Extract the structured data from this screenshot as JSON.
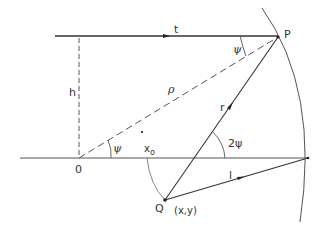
{
  "diagram": {
    "type": "geometry",
    "colors": {
      "line": "#333333",
      "background": "#ffffff",
      "arc": "#555555"
    },
    "labels": {
      "t": "t",
      "P": "P",
      "psi_top": "ψ",
      "h": "h",
      "rho": "ρ",
      "r": "r",
      "O": "0",
      "psi_origin": "ψ",
      "x0": "x",
      "x0_sub": "o",
      "two_psi": "2ψ",
      "l": "l",
      "Q": "Q",
      "Q_coords": "(x,y)"
    },
    "points": {
      "O": [
        79,
        158
      ],
      "P": [
        278,
        37
      ],
      "Q": [
        165,
        200
      ],
      "x0": [
        145,
        158
      ],
      "arc_axis_intersection": [
        308,
        158
      ],
      "h_top": [
        79,
        36
      ],
      "dot": [
        142,
        132
      ]
    },
    "segments": [
      {
        "name": "line-t",
        "from": [
          55,
          36
        ],
        "to": [
          278,
          36
        ],
        "style": "solid",
        "arrow": "mid"
      },
      {
        "name": "horizontal-axis",
        "from": [
          20,
          158
        ],
        "to": [
          308,
          158
        ],
        "style": "solid"
      },
      {
        "name": "height-h",
        "from": [
          79,
          36
        ],
        "to": [
          79,
          158
        ],
        "style": "dashed"
      },
      {
        "name": "line-rho",
        "from": [
          79,
          158
        ],
        "to": [
          278,
          37
        ],
        "style": "dashed"
      },
      {
        "name": "line-r",
        "from": [
          165,
          200
        ],
        "to": [
          278,
          37
        ],
        "style": "solid",
        "arrow": "mid"
      },
      {
        "name": "line-l",
        "from": [
          165,
          200
        ],
        "to": [
          308,
          158
        ],
        "style": "solid",
        "arrow": "mid"
      }
    ],
    "arcs": [
      {
        "name": "wavefront-arc",
        "style": "solid"
      },
      {
        "name": "x0-to-Q-arc",
        "style": "solid-thin"
      },
      {
        "name": "angle-psi-at-O",
        "style": "thin"
      },
      {
        "name": "angle-psi-at-P",
        "style": "thin"
      },
      {
        "name": "angle-2psi",
        "style": "thin"
      }
    ]
  }
}
